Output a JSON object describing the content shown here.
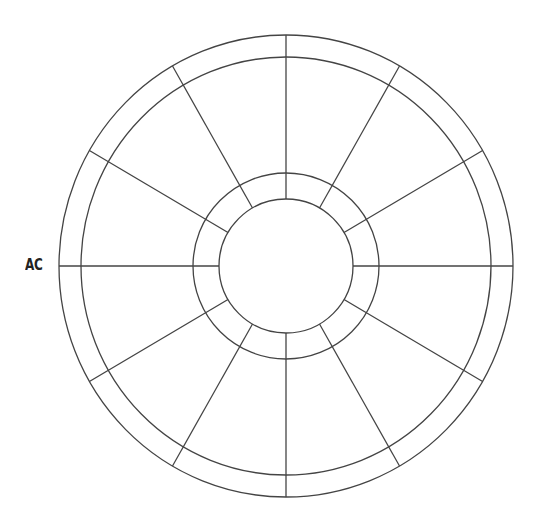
{
  "diagram": {
    "type": "astrology-house-wheel",
    "label": "AC",
    "house_count": 12,
    "line_color": "#444444",
    "center": [
      286,
      266
    ],
    "rings": [
      {
        "name": "outer",
        "rx": 227,
        "ry": 231
      },
      {
        "name": "zodiac-band-inner",
        "rx": 205,
        "ry": 209
      },
      {
        "name": "house-band-outer",
        "rx": 93,
        "ry": 93
      },
      {
        "name": "inner",
        "rx": 67,
        "ry": 67
      }
    ]
  }
}
